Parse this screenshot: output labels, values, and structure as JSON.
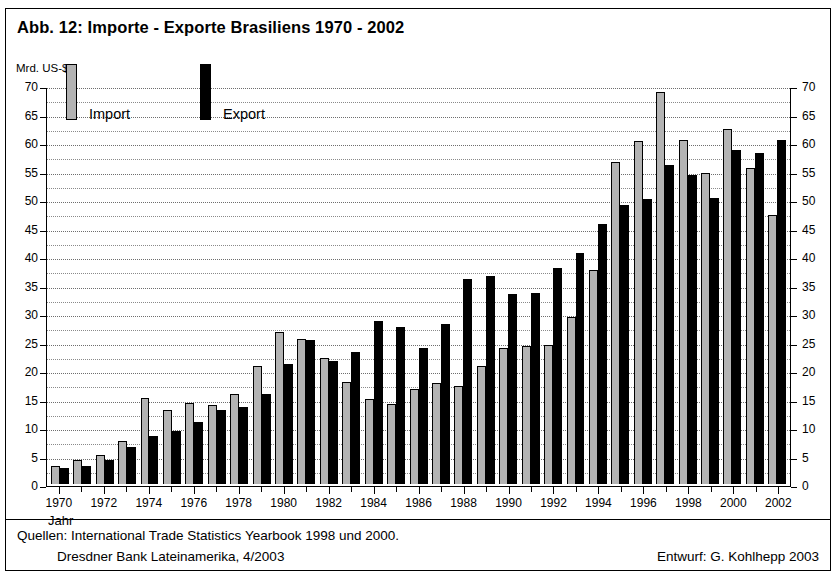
{
  "figure": {
    "title": "Abb. 12: Importe - Exporte Brasiliens 1970 - 2002",
    "y_unit_label": "Mrd. US-$",
    "x_axis_name": "Jahr"
  },
  "legend": {
    "import_label": "Import",
    "export_label": "Export",
    "import_color": "#b3b3b3",
    "export_color": "#000000"
  },
  "footer": {
    "source_line_1": "Quellen: International Trade Statistics Yearbook 1998 und 2000.",
    "source_line_2": "Dresdner Bank Lateinamerika, 4/2003",
    "credit": "Entwurf: G. Kohlhepp 2003"
  },
  "chart_data": {
    "type": "bar",
    "title": "Abb. 12: Importe - Exporte Brasiliens 1970 - 2002",
    "xlabel": "Jahr",
    "ylabel": "Mrd. US-$",
    "ylim": [
      0,
      70
    ],
    "ytick_step": 5,
    "minor_grid_step": 2.5,
    "grid": true,
    "legend_position": "inside-top-left",
    "dual_y_axis": true,
    "yticks": [
      0,
      5,
      10,
      15,
      20,
      25,
      30,
      35,
      40,
      45,
      50,
      55,
      60,
      65,
      70
    ],
    "categories": [
      "1970",
      "1971",
      "1972",
      "1973",
      "1974",
      "1975",
      "1976",
      "1977",
      "1978",
      "1979",
      "1980",
      "1981",
      "1982",
      "1983",
      "1984",
      "1985",
      "1986",
      "1987",
      "1988",
      "1989",
      "1990",
      "1991",
      "1992",
      "1993",
      "1994",
      "1995",
      "1996",
      "1997",
      "1998",
      "1999",
      "2000",
      "2001",
      "2002"
    ],
    "xtick_labels": [
      "1970",
      "",
      "1972",
      "",
      "1974",
      "",
      "1976",
      "",
      "1978",
      "",
      "1980",
      "",
      "1982",
      "",
      "1984",
      "",
      "1986",
      "",
      "1988",
      "",
      "1990",
      "",
      "1992",
      "",
      "1994",
      "",
      "1996",
      "",
      "1998",
      "",
      "2000",
      "",
      "2002"
    ],
    "series": [
      {
        "name": "Import",
        "color": "#b3b3b3",
        "values": [
          3.3,
          4.2,
          5.1,
          7.7,
          15.2,
          13.0,
          14.3,
          13.9,
          15.8,
          20.8,
          26.8,
          25.5,
          22.2,
          18.0,
          14.9,
          14.1,
          16.8,
          17.8,
          17.3,
          20.7,
          23.9,
          24.3,
          24.4,
          29.3,
          37.7,
          56.5,
          60.3,
          68.8,
          60.5,
          54.7,
          62.3,
          55.6,
          47.2
        ]
      },
      {
        "name": "Export",
        "color": "#000000",
        "values": [
          2.9,
          3.3,
          4.2,
          6.6,
          8.5,
          9.4,
          10.9,
          13.0,
          13.6,
          15.9,
          21.2,
          25.4,
          21.6,
          23.3,
          28.6,
          27.7,
          23.9,
          28.2,
          36.0,
          36.6,
          33.4,
          33.5,
          38.0,
          40.6,
          45.7,
          49.0,
          50.1,
          56.0,
          54.3,
          50.2,
          58.6,
          58.2,
          60.4
        ]
      }
    ]
  }
}
